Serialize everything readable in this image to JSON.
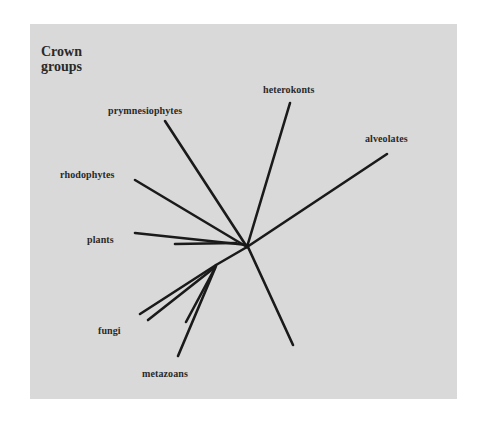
{
  "diagram": {
    "title": "Crown\ngroups",
    "type": "unrooted phylogenetic tree",
    "background_color": "#d9d9d9",
    "line_color": "#1a1a1a",
    "center": [
      247,
      247
    ],
    "branches": [
      {
        "name": "prymnesiophytes",
        "label": "prymnesiophytes",
        "ends": [
          [
            165,
            121
          ]
        ]
      },
      {
        "name": "heterokonts",
        "label": "heterokonts",
        "ends": [
          [
            290,
            103
          ]
        ]
      },
      {
        "name": "alveolates",
        "label": "alveolates",
        "ends": [
          [
            387,
            154
          ]
        ]
      },
      {
        "name": "rhodophytes",
        "label": "rhodophytes",
        "ends": [
          [
            135,
            180
          ]
        ]
      },
      {
        "name": "plants",
        "label": "plants",
        "ends": [
          [
            135,
            233
          ],
          [
            175,
            243
          ]
        ]
      },
      {
        "name": "fungi",
        "label": "fungi",
        "ends": [
          [
            140,
            314
          ],
          [
            148,
            320
          ]
        ]
      },
      {
        "name": "metazoans",
        "label": "metazoans",
        "ends": [
          [
            185,
            322
          ],
          [
            178,
            356
          ]
        ]
      },
      {
        "name": "unlabeled",
        "label": "",
        "ends": [
          [
            293,
            345
          ]
        ]
      }
    ]
  },
  "labels": {
    "prymnesiophytes": "prymnesiophytes",
    "heterokonts": "heterokonts",
    "alveolates": "alveolates",
    "rhodophytes": "rhodophytes",
    "plants": "plants",
    "fungi": "fungi",
    "metazoans": "metazoans"
  }
}
